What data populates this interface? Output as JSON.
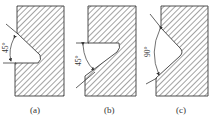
{
  "figure": {
    "panels": [
      {
        "id": "a",
        "caption": "(a)",
        "angle_label": "45°",
        "notch_type": "angled notch, lower face horizontal"
      },
      {
        "id": "b",
        "caption": "(b)",
        "angle_label": "45°",
        "notch_type": "angled notch, upper face horizontal"
      },
      {
        "id": "c",
        "caption": "(c)",
        "angle_label": "90°",
        "notch_type": "symmetric V notch"
      }
    ],
    "colors": {
      "line": "#3a3a3a",
      "hatch": "#555555",
      "background": "#ffffff"
    }
  }
}
